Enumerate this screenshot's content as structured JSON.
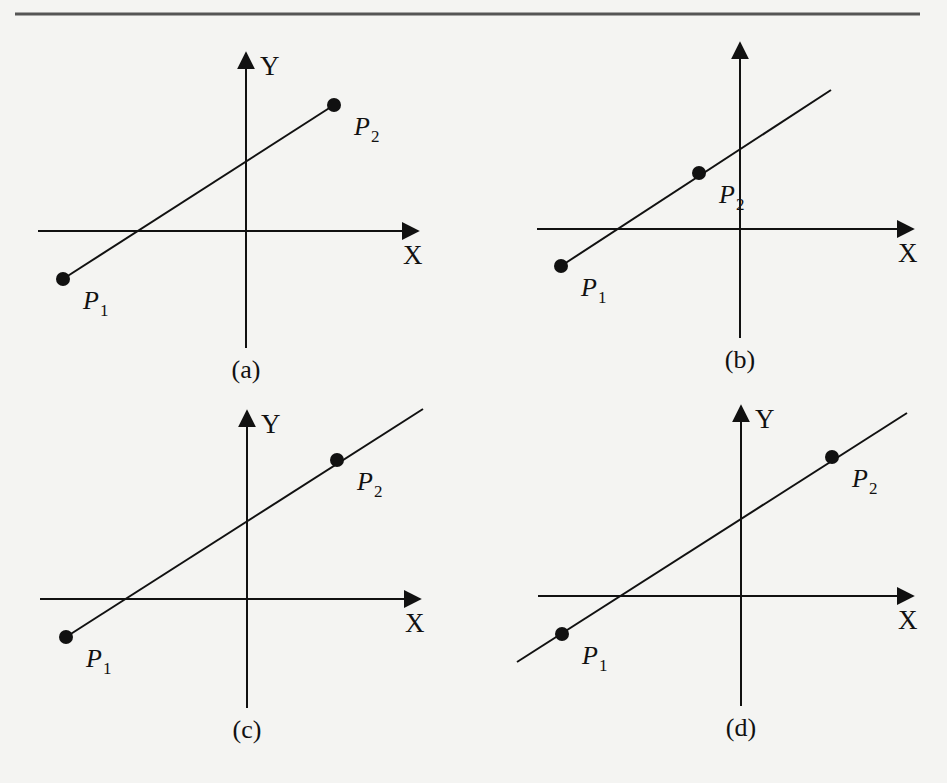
{
  "page": {
    "top_rule": {
      "x1": 15,
      "x2": 920,
      "y": 14
    }
  },
  "panels": [
    {
      "id": "a",
      "caption": "(a)",
      "axis_x_label": "X",
      "axis_y_label": "Y",
      "show_y_label": true,
      "origin": [
        246,
        231
      ],
      "x_axis": [
        38,
        418
      ],
      "y_axis": [
        53,
        348
      ],
      "p1": {
        "label": "P",
        "sub": "1",
        "pos": [
          63,
          279
        ]
      },
      "p2": {
        "label": "P",
        "sub": "2",
        "pos": [
          334,
          105
        ]
      },
      "line": [
        [
          63,
          279
        ],
        [
          334,
          105
        ]
      ],
      "line_type": "segment"
    },
    {
      "id": "b",
      "caption": "(b)",
      "axis_x_label": "X",
      "axis_y_label": "",
      "show_y_label": false,
      "origin": [
        740,
        229
      ],
      "x_axis": [
        537,
        913
      ],
      "y_axis": [
        43,
        338
      ],
      "p1": {
        "label": "P",
        "sub": "1",
        "pos": [
          561,
          266
        ]
      },
      "p2": {
        "label": "P",
        "sub": "2",
        "pos": [
          699,
          173
        ]
      },
      "line": [
        [
          561,
          266
        ],
        [
          831,
          90
        ]
      ],
      "line_type": "ray"
    },
    {
      "id": "c",
      "caption": "(c)",
      "axis_x_label": "X",
      "axis_y_label": "Y",
      "show_y_label": true,
      "origin": [
        247,
        599
      ],
      "x_axis": [
        40,
        420
      ],
      "y_axis": [
        411,
        708
      ],
      "p1": {
        "label": "P",
        "sub": "1",
        "pos": [
          66,
          637
        ]
      },
      "p2": {
        "label": "P",
        "sub": "2",
        "pos": [
          337,
          460
        ]
      },
      "line": [
        [
          66,
          637
        ],
        [
          423,
          409
        ]
      ],
      "line_type": "ray"
    },
    {
      "id": "d",
      "caption": "(d)",
      "axis_x_label": "X",
      "axis_y_label": "Y",
      "show_y_label": true,
      "origin": [
        741,
        596
      ],
      "x_axis": [
        538,
        913
      ],
      "y_axis": [
        406,
        706
      ],
      "p1": {
        "label": "P",
        "sub": "1",
        "pos": [
          562,
          634
        ]
      },
      "p2": {
        "label": "P",
        "sub": "2",
        "pos": [
          832,
          457
        ]
      },
      "line": [
        [
          517,
          662
        ],
        [
          907,
          413
        ]
      ],
      "line_type": "line"
    }
  ],
  "colors": {
    "ink": "#111111",
    "background": "#f4f4f2",
    "rule": "#555555"
  }
}
